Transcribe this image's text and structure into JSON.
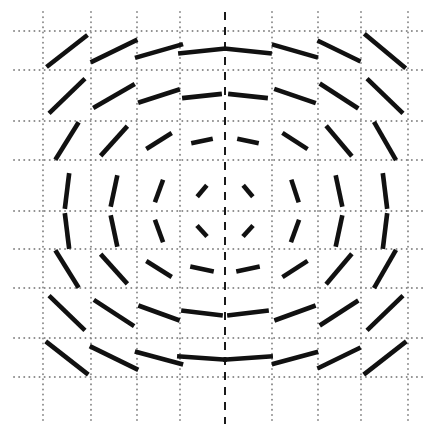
{
  "figure": {
    "width": 435,
    "height": 436,
    "background_color": "#ffffff",
    "title": "",
    "caption": ""
  },
  "style": {
    "whisker_color": "#111111",
    "grid_color": "#8a8a8a",
    "center_line_color": "#1a1a1a",
    "whisker_linewidth": 4.6,
    "grid_dot_radius": 0.95,
    "grid_dot_spacing": 5.0,
    "center_dash_pattern": "8 7",
    "center_linewidth": 2.0
  },
  "axes": {
    "x_range": [
      14,
      424
    ],
    "y_range": [
      12,
      424
    ],
    "xlabel": "",
    "ylabel": "",
    "xticks": [],
    "yticks": [],
    "grid": true,
    "grid_style": "dotted"
  },
  "grid_lines": {
    "vertical_x": [
      43,
      91,
      137,
      180,
      225,
      272,
      318,
      361,
      408
    ],
    "horizontal_y": [
      31,
      70,
      121,
      160,
      211,
      249,
      288,
      338,
      377
    ],
    "center_vertical_x": 225,
    "dense_dot_rows": [
      31,
      70,
      121,
      160,
      249,
      288,
      338,
      377
    ],
    "note": "dotted grid, center column drawn as dashed line"
  },
  "chart_data": {
    "type": "scatter",
    "subtype": "whisker-ellipticity-field",
    "title": "",
    "xlabel": "",
    "ylabel": "",
    "xlim": [
      0,
      435
    ],
    "ylim": [
      0,
      436
    ],
    "grid": true,
    "legend": null,
    "grid_shape": [
      8,
      8
    ],
    "centre": [
      225,
      211
    ],
    "columns_x": [
      67,
      114,
      159,
      202,
      248,
      295,
      339,
      385
    ],
    "rows_y": [
      51,
      96,
      141,
      191,
      231,
      269,
      313,
      358
    ],
    "whiskers": [
      {
        "id": "r1c1",
        "row": 1,
        "col": 1,
        "x": 67,
        "y": 51,
        "angle_deg": 38,
        "length": 52
      },
      {
        "id": "r1c2",
        "row": 1,
        "col": 2,
        "x": 114,
        "y": 51,
        "angle_deg": 26,
        "length": 52
      },
      {
        "id": "r1c3",
        "row": 1,
        "col": 3,
        "x": 159,
        "y": 51,
        "angle_deg": 16,
        "length": 50
      },
      {
        "id": "r1c4",
        "row": 1,
        "col": 4,
        "x": 202,
        "y": 51,
        "angle_deg": 6,
        "length": 48
      },
      {
        "id": "r1c5",
        "row": 1,
        "col": 5,
        "x": 248,
        "y": 51,
        "angle_deg": -6,
        "length": 48
      },
      {
        "id": "r1c6",
        "row": 1,
        "col": 6,
        "x": 295,
        "y": 51,
        "angle_deg": -16,
        "length": 48
      },
      {
        "id": "r1c7",
        "row": 1,
        "col": 7,
        "x": 339,
        "y": 51,
        "angle_deg": -26,
        "length": 48
      },
      {
        "id": "r1c8",
        "row": 1,
        "col": 8,
        "x": 385,
        "y": 51,
        "angle_deg": -40,
        "length": 54
      },
      {
        "id": "r2c1",
        "row": 2,
        "col": 1,
        "x": 67,
        "y": 96,
        "angle_deg": 44,
        "length": 50
      },
      {
        "id": "r2c2",
        "row": 2,
        "col": 2,
        "x": 114,
        "y": 96,
        "angle_deg": 30,
        "length": 48
      },
      {
        "id": "r2c3",
        "row": 2,
        "col": 3,
        "x": 159,
        "y": 96,
        "angle_deg": 18,
        "length": 44
      },
      {
        "id": "r2c4",
        "row": 2,
        "col": 4,
        "x": 202,
        "y": 96,
        "angle_deg": 6,
        "length": 40
      },
      {
        "id": "r2c5",
        "row": 2,
        "col": 5,
        "x": 248,
        "y": 96,
        "angle_deg": -6,
        "length": 40
      },
      {
        "id": "r2c6",
        "row": 2,
        "col": 6,
        "x": 295,
        "y": 96,
        "angle_deg": -19,
        "length": 44
      },
      {
        "id": "r2c7",
        "row": 2,
        "col": 7,
        "x": 339,
        "y": 96,
        "angle_deg": -33,
        "length": 46
      },
      {
        "id": "r2c8",
        "row": 2,
        "col": 8,
        "x": 385,
        "y": 96,
        "angle_deg": -44,
        "length": 50
      },
      {
        "id": "r3c1",
        "row": 3,
        "col": 1,
        "x": 67,
        "y": 141,
        "angle_deg": 58,
        "length": 44
      },
      {
        "id": "r3c2",
        "row": 3,
        "col": 2,
        "x": 114,
        "y": 141,
        "angle_deg": 48,
        "length": 40
      },
      {
        "id": "r3c3",
        "row": 3,
        "col": 3,
        "x": 159,
        "y": 141,
        "angle_deg": 32,
        "length": 30
      },
      {
        "id": "r3c4",
        "row": 3,
        "col": 4,
        "x": 202,
        "y": 141,
        "angle_deg": 12,
        "length": 22
      },
      {
        "id": "r3c5",
        "row": 3,
        "col": 5,
        "x": 248,
        "y": 141,
        "angle_deg": -12,
        "length": 22
      },
      {
        "id": "r3c6",
        "row": 3,
        "col": 6,
        "x": 295,
        "y": 141,
        "angle_deg": -33,
        "length": 30
      },
      {
        "id": "r3c7",
        "row": 3,
        "col": 7,
        "x": 339,
        "y": 141,
        "angle_deg": -50,
        "length": 40
      },
      {
        "id": "r3c8",
        "row": 3,
        "col": 8,
        "x": 385,
        "y": 141,
        "angle_deg": -60,
        "length": 44
      },
      {
        "id": "r4c1",
        "row": 4,
        "col": 1,
        "x": 67,
        "y": 191,
        "angle_deg": 83,
        "length": 36
      },
      {
        "id": "r4c2",
        "row": 4,
        "col": 2,
        "x": 114,
        "y": 191,
        "angle_deg": 78,
        "length": 32
      },
      {
        "id": "r4c3",
        "row": 4,
        "col": 3,
        "x": 159,
        "y": 191,
        "angle_deg": 70,
        "length": 24
      },
      {
        "id": "r4c4",
        "row": 4,
        "col": 4,
        "x": 202,
        "y": 191,
        "angle_deg": 50,
        "length": 15
      },
      {
        "id": "r4c5",
        "row": 4,
        "col": 5,
        "x": 248,
        "y": 191,
        "angle_deg": -50,
        "length": 15
      },
      {
        "id": "r4c6",
        "row": 4,
        "col": 6,
        "x": 295,
        "y": 191,
        "angle_deg": -72,
        "length": 24
      },
      {
        "id": "r4c7",
        "row": 4,
        "col": 7,
        "x": 339,
        "y": 191,
        "angle_deg": -78,
        "length": 32
      },
      {
        "id": "r4c8",
        "row": 4,
        "col": 8,
        "x": 385,
        "y": 191,
        "angle_deg": -83,
        "length": 36
      },
      {
        "id": "r5c1",
        "row": 5,
        "col": 1,
        "x": 67,
        "y": 231,
        "angle_deg": -83,
        "length": 36
      },
      {
        "id": "r5c2",
        "row": 5,
        "col": 2,
        "x": 114,
        "y": 231,
        "angle_deg": -78,
        "length": 32
      },
      {
        "id": "r5c3",
        "row": 5,
        "col": 3,
        "x": 159,
        "y": 231,
        "angle_deg": -70,
        "length": 24
      },
      {
        "id": "r5c4",
        "row": 5,
        "col": 4,
        "x": 202,
        "y": 231,
        "angle_deg": -48,
        "length": 15
      },
      {
        "id": "r5c5",
        "row": 5,
        "col": 5,
        "x": 248,
        "y": 231,
        "angle_deg": 48,
        "length": 15
      },
      {
        "id": "r5c6",
        "row": 5,
        "col": 6,
        "x": 295,
        "y": 231,
        "angle_deg": 70,
        "length": 24
      },
      {
        "id": "r5c7",
        "row": 5,
        "col": 7,
        "x": 339,
        "y": 231,
        "angle_deg": 78,
        "length": 32
      },
      {
        "id": "r5c8",
        "row": 5,
        "col": 8,
        "x": 385,
        "y": 231,
        "angle_deg": 83,
        "length": 36
      },
      {
        "id": "r6c1",
        "row": 6,
        "col": 1,
        "x": 67,
        "y": 269,
        "angle_deg": -58,
        "length": 44
      },
      {
        "id": "r6c2",
        "row": 6,
        "col": 2,
        "x": 114,
        "y": 269,
        "angle_deg": -48,
        "length": 40
      },
      {
        "id": "r6c3",
        "row": 6,
        "col": 3,
        "x": 159,
        "y": 269,
        "angle_deg": -32,
        "length": 30
      },
      {
        "id": "r6c4",
        "row": 6,
        "col": 4,
        "x": 202,
        "y": 269,
        "angle_deg": -12,
        "length": 24
      },
      {
        "id": "r6c5",
        "row": 6,
        "col": 5,
        "x": 248,
        "y": 269,
        "angle_deg": 12,
        "length": 24
      },
      {
        "id": "r6c6",
        "row": 6,
        "col": 6,
        "x": 295,
        "y": 269,
        "angle_deg": 33,
        "length": 30
      },
      {
        "id": "r6c7",
        "row": 6,
        "col": 7,
        "x": 339,
        "y": 269,
        "angle_deg": 50,
        "length": 40
      },
      {
        "id": "r6c8",
        "row": 6,
        "col": 8,
        "x": 385,
        "y": 269,
        "angle_deg": 60,
        "length": 44
      },
      {
        "id": "r7c1",
        "row": 7,
        "col": 1,
        "x": 67,
        "y": 313,
        "angle_deg": -44,
        "length": 50
      },
      {
        "id": "r7c2",
        "row": 7,
        "col": 2,
        "x": 114,
        "y": 313,
        "angle_deg": -33,
        "length": 48
      },
      {
        "id": "r7c3",
        "row": 7,
        "col": 3,
        "x": 159,
        "y": 313,
        "angle_deg": -20,
        "length": 44
      },
      {
        "id": "r7c4",
        "row": 7,
        "col": 4,
        "x": 202,
        "y": 313,
        "angle_deg": -7,
        "length": 42
      },
      {
        "id": "r7c5",
        "row": 7,
        "col": 5,
        "x": 248,
        "y": 313,
        "angle_deg": 7,
        "length": 42
      },
      {
        "id": "r7c6",
        "row": 7,
        "col": 6,
        "x": 295,
        "y": 313,
        "angle_deg": 20,
        "length": 44
      },
      {
        "id": "r7c7",
        "row": 7,
        "col": 7,
        "x": 339,
        "y": 313,
        "angle_deg": 33,
        "length": 46
      },
      {
        "id": "r7c8",
        "row": 7,
        "col": 8,
        "x": 385,
        "y": 313,
        "angle_deg": 44,
        "length": 50
      },
      {
        "id": "r8c1",
        "row": 8,
        "col": 1,
        "x": 67,
        "y": 358,
        "angle_deg": -38,
        "length": 54
      },
      {
        "id": "r8c2",
        "row": 8,
        "col": 2,
        "x": 114,
        "y": 358,
        "angle_deg": -26,
        "length": 54
      },
      {
        "id": "r8c3",
        "row": 8,
        "col": 3,
        "x": 159,
        "y": 358,
        "angle_deg": -15,
        "length": 50
      },
      {
        "id": "r8c4",
        "row": 8,
        "col": 4,
        "x": 202,
        "y": 358,
        "angle_deg": -4,
        "length": 50
      },
      {
        "id": "r8c5",
        "row": 8,
        "col": 5,
        "x": 248,
        "y": 358,
        "angle_deg": 4,
        "length": 50
      },
      {
        "id": "r8c6",
        "row": 8,
        "col": 6,
        "x": 295,
        "y": 358,
        "angle_deg": 15,
        "length": 48
      },
      {
        "id": "r8c7",
        "row": 8,
        "col": 7,
        "x": 339,
        "y": 358,
        "angle_deg": 26,
        "length": 48
      },
      {
        "id": "r8c8",
        "row": 8,
        "col": 8,
        "x": 385,
        "y": 358,
        "angle_deg": 38,
        "length": 54
      }
    ]
  }
}
